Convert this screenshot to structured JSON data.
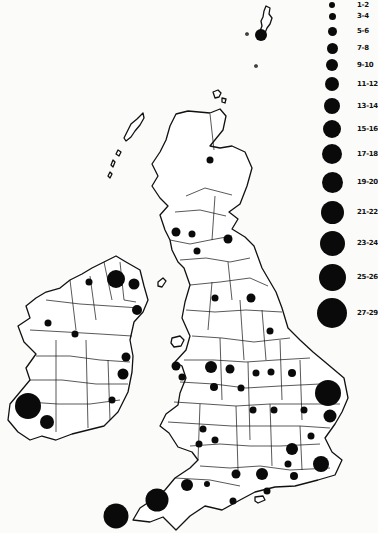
{
  "legend": {
    "items": [
      {
        "label": "1-2",
        "y": 5,
        "r": 3
      },
      {
        "label": "3-4",
        "y": 16,
        "r": 3.5
      },
      {
        "label": "5-6",
        "y": 31,
        "r": 4.5
      },
      {
        "label": "7-8",
        "y": 48,
        "r": 5.5
      },
      {
        "label": "9-10",
        "y": 65,
        "r": 6
      },
      {
        "label": "11-12",
        "y": 84,
        "r": 7
      },
      {
        "label": "13-14",
        "y": 106,
        "r": 8
      },
      {
        "label": "15-16",
        "y": 129,
        "r": 9
      },
      {
        "label": "17-18",
        "y": 154,
        "r": 10
      },
      {
        "label": "19-20",
        "y": 182,
        "r": 10.5
      },
      {
        "label": "21-22",
        "y": 212,
        "r": 11.5
      },
      {
        "label": "23-24",
        "y": 243,
        "r": 12.5
      },
      {
        "label": "25-26",
        "y": 277,
        "r": 13.5
      },
      {
        "label": "27-29",
        "y": 313,
        "r": 15
      }
    ]
  },
  "map": {
    "dots": [
      {
        "x": 261,
        "y": 35,
        "r": 6
      },
      {
        "x": 210,
        "y": 160,
        "r": 3.5
      },
      {
        "x": 176,
        "y": 232,
        "r": 4.5
      },
      {
        "x": 192,
        "y": 234,
        "r": 3.5
      },
      {
        "x": 228,
        "y": 239,
        "r": 4.5
      },
      {
        "x": 197,
        "y": 251,
        "r": 3.5
      },
      {
        "x": 116,
        "y": 279,
        "r": 9
      },
      {
        "x": 134,
        "y": 284,
        "r": 5.5
      },
      {
        "x": 89,
        "y": 282,
        "r": 3.5
      },
      {
        "x": 137,
        "y": 310,
        "r": 5
      },
      {
        "x": 215,
        "y": 298,
        "r": 3.5
      },
      {
        "x": 251,
        "y": 298,
        "r": 4.5
      },
      {
        "x": 48,
        "y": 323,
        "r": 3.5
      },
      {
        "x": 75,
        "y": 334,
        "r": 3.5
      },
      {
        "x": 270,
        "y": 331,
        "r": 3.5
      },
      {
        "x": 126,
        "y": 357,
        "r": 4.5
      },
      {
        "x": 123,
        "y": 374,
        "r": 5.5
      },
      {
        "x": 211,
        "y": 367,
        "r": 6
      },
      {
        "x": 176,
        "y": 366,
        "r": 4.5
      },
      {
        "x": 182,
        "y": 377,
        "r": 3.5
      },
      {
        "x": 230,
        "y": 369,
        "r": 4.5
      },
      {
        "x": 256,
        "y": 373,
        "r": 3.5
      },
      {
        "x": 271,
        "y": 372,
        "r": 3.5
      },
      {
        "x": 292,
        "y": 373,
        "r": 4
      },
      {
        "x": 241,
        "y": 388,
        "r": 3.5
      },
      {
        "x": 214,
        "y": 387,
        "r": 4
      },
      {
        "x": 112,
        "y": 400,
        "r": 3.5
      },
      {
        "x": 28,
        "y": 406,
        "r": 13
      },
      {
        "x": 47,
        "y": 422,
        "r": 7
      },
      {
        "x": 328,
        "y": 393,
        "r": 13
      },
      {
        "x": 330,
        "y": 416,
        "r": 6.5
      },
      {
        "x": 253,
        "y": 410,
        "r": 3.5
      },
      {
        "x": 274,
        "y": 410,
        "r": 3.5
      },
      {
        "x": 304,
        "y": 410,
        "r": 3.5
      },
      {
        "x": 203,
        "y": 429,
        "r": 3.5
      },
      {
        "x": 215,
        "y": 440,
        "r": 3.5
      },
      {
        "x": 199,
        "y": 444,
        "r": 3.5
      },
      {
        "x": 311,
        "y": 436,
        "r": 3.5
      },
      {
        "x": 292,
        "y": 449,
        "r": 6
      },
      {
        "x": 288,
        "y": 464,
        "r": 3.5
      },
      {
        "x": 321,
        "y": 464,
        "r": 8
      },
      {
        "x": 236,
        "y": 474,
        "r": 4.5
      },
      {
        "x": 294,
        "y": 476,
        "r": 4
      },
      {
        "x": 262,
        "y": 474,
        "r": 6
      },
      {
        "x": 233,
        "y": 501,
        "r": 3.5
      },
      {
        "x": 267,
        "y": 491,
        "r": 3.5
      },
      {
        "x": 187,
        "y": 485,
        "r": 6
      },
      {
        "x": 207,
        "y": 484,
        "r": 3
      },
      {
        "x": 157,
        "y": 500,
        "r": 11.5
      },
      {
        "x": 116,
        "y": 516,
        "r": 12.5
      }
    ]
  }
}
